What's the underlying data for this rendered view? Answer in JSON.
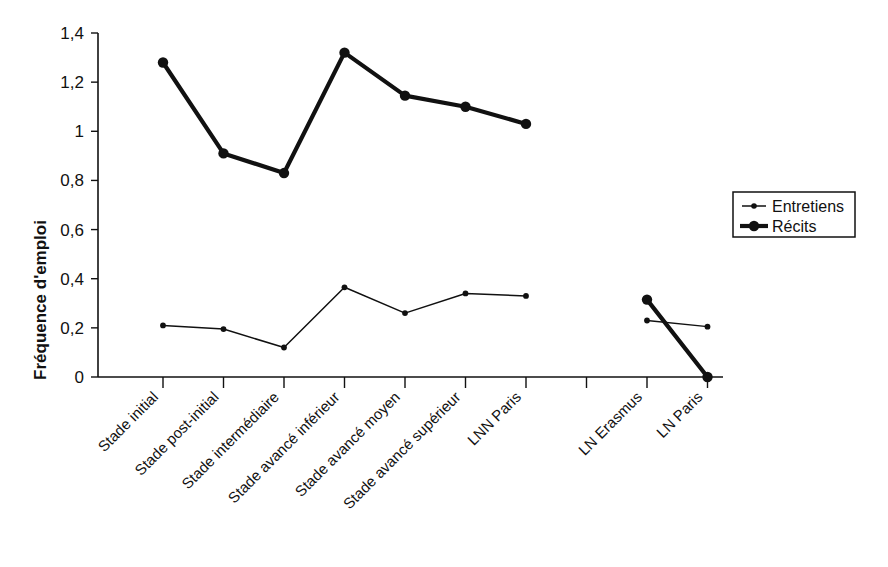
{
  "chart_data": {
    "type": "line",
    "title": "",
    "xlabel": "",
    "ylabel": "Fréquence d'emploi",
    "ylim": [
      0,
      1.4
    ],
    "ytick_labels": [
      "0",
      "0,2",
      "0,4",
      "0,6",
      "0,8",
      "1",
      "1,2",
      "1,4"
    ],
    "ytick_values": [
      0,
      0.2,
      0.4,
      0.6,
      0.8,
      1.0,
      1.2,
      1.4
    ],
    "grid": false,
    "legend_position": "right",
    "categories": [
      "Stade initial",
      "Stade post-initial",
      "Stade intermédiaire",
      "Stade avancé inférieur",
      "Stade avancé moyen",
      "Stade avancé supérieur",
      "LNN Paris",
      "",
      "LN Erasmus",
      "LN Paris"
    ],
    "series": [
      {
        "name": "Entretiens",
        "marker": "small-dot",
        "line_width": "thin",
        "values": [
          0.21,
          0.195,
          0.12,
          0.365,
          0.26,
          0.34,
          0.33,
          null,
          0.23,
          0.205
        ]
      },
      {
        "name": "Récits",
        "marker": "large-dot",
        "line_width": "thick",
        "values": [
          1.28,
          0.91,
          0.83,
          1.32,
          1.145,
          1.1,
          1.03,
          null,
          0.315,
          0.0
        ]
      }
    ]
  },
  "legend": {
    "entries": [
      {
        "label": "Entretiens",
        "style": "thin"
      },
      {
        "label": "Récits",
        "style": "thick"
      }
    ]
  },
  "colors": {
    "line": "#111111",
    "background": "#ffffff",
    "axis": "#111111"
  }
}
